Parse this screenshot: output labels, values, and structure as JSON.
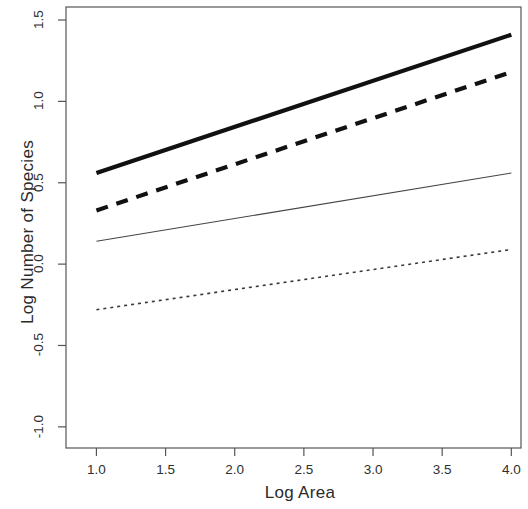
{
  "chart_data": {
    "type": "line",
    "title": "",
    "xlabel": "Log Area",
    "ylabel": "Log Number of Species",
    "xlim": [
      0.78,
      4.07
    ],
    "ylim": [
      -1.13,
      1.58
    ],
    "xticks": [
      "1.0",
      "1.5",
      "2.0",
      "2.5",
      "3.0",
      "3.5",
      "4.0"
    ],
    "xtick_values": [
      1.0,
      1.5,
      2.0,
      2.5,
      3.0,
      3.5,
      4.0
    ],
    "yticks": [
      "1.5",
      "1.0",
      "0.5",
      "0.0",
      "-0.5",
      "-1.0"
    ],
    "ytick_values": [
      1.5,
      1.0,
      0.5,
      0.0,
      -0.5,
      -1.0
    ],
    "grid": false,
    "legend_position": "none",
    "box": true,
    "series": [
      {
        "name": "line-1-thick-solid",
        "style": "solid",
        "width": 4.2,
        "color": "#111111",
        "x": [
          1.0,
          4.0
        ],
        "values": [
          0.56,
          1.41
        ]
      },
      {
        "name": "line-2-thick-dashed",
        "style": "dashed",
        "width": 4.2,
        "color": "#111111",
        "x": [
          1.0,
          4.0
        ],
        "values": [
          0.33,
          1.18
        ]
      },
      {
        "name": "line-3-thin-solid",
        "style": "solid",
        "width": 1.1,
        "color": "#444444",
        "x": [
          1.0,
          4.0
        ],
        "values": [
          0.14,
          0.56
        ]
      },
      {
        "name": "line-4-dotted",
        "style": "dotted",
        "width": 1.6,
        "color": "#3a3a3a",
        "x": [
          1.0,
          4.0
        ],
        "values": [
          -0.28,
          0.09
        ]
      }
    ]
  }
}
